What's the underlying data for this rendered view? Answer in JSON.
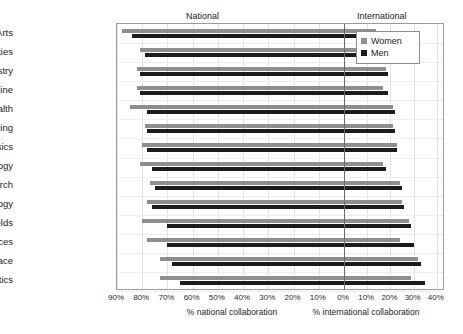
{
  "headers": {
    "left": "National",
    "right": "International"
  },
  "legend": {
    "position": "top-right",
    "items": [
      {
        "label": "Women",
        "color": "#8e8e8e",
        "key": "women"
      },
      {
        "label": "Men",
        "color": "#1c1c1c",
        "key": "men"
      }
    ]
  },
  "axis": {
    "left_title": "% national collaboration",
    "right_title": "% international collaboration",
    "ticks": [
      {
        "label": "90%",
        "value_national": 90
      },
      {
        "label": "80%",
        "value_national": 80
      },
      {
        "label": "70%",
        "value_national": 70
      },
      {
        "label": "60%",
        "value_national": 60
      },
      {
        "label": "50%",
        "value_national": 50
      },
      {
        "label": "40%",
        "value_national": 40
      },
      {
        "label": "30%",
        "value_national": 30
      },
      {
        "label": "20%",
        "value_national": 20
      },
      {
        "label": "10%",
        "value_national": 10
      },
      {
        "label": "0%",
        "value_national": 0
      },
      {
        "label": "10%",
        "value_international": 10
      },
      {
        "label": "20%",
        "value_international": 20
      },
      {
        "label": "30%",
        "value_international": 30
      },
      {
        "label": "40%",
        "value_international": 40
      }
    ]
  },
  "chart_data": {
    "type": "bar",
    "orientation": "horizontal",
    "style": "diverging-butterfly",
    "title": "",
    "xlabel_left": "% national collaboration",
    "xlabel_right": "% international collaboration",
    "ylabel": "",
    "grid": true,
    "legend_position": "top-right",
    "xlim_left": [
      0,
      90
    ],
    "xlim_right": [
      0,
      40
    ],
    "xtick_left": [
      90,
      80,
      70,
      60,
      50,
      40,
      30,
      20,
      10,
      0
    ],
    "xtick_right": [
      10,
      20,
      30,
      40
    ],
    "categories": [
      "Arts",
      "Humanities",
      "Chemistry",
      "Clinical medicine",
      "Health",
      "Engineering",
      "Physics",
      "Psychology",
      "Biomedical research",
      "Biology",
      "Professional fields",
      "Social sciences",
      "Earth and space",
      "Mathematics"
    ],
    "series": [
      {
        "name": "Women",
        "color": "#8e8e8e",
        "national": [
          88,
          81,
          82,
          82,
          85,
          79,
          80,
          81,
          77,
          78,
          80,
          78,
          73,
          73
        ],
        "international": [
          14,
          19,
          18,
          17,
          21,
          21,
          23,
          17,
          24,
          25,
          28,
          24,
          32,
          29
        ]
      },
      {
        "name": "Men",
        "color": "#1c1c1c",
        "national": [
          84,
          79,
          81,
          81,
          78,
          78,
          78,
          76,
          75,
          76,
          70,
          70,
          68,
          65
        ],
        "international": [
          15,
          19,
          19,
          19,
          22,
          22,
          23,
          18,
          25,
          26,
          29,
          30,
          33,
          35
        ]
      }
    ]
  }
}
